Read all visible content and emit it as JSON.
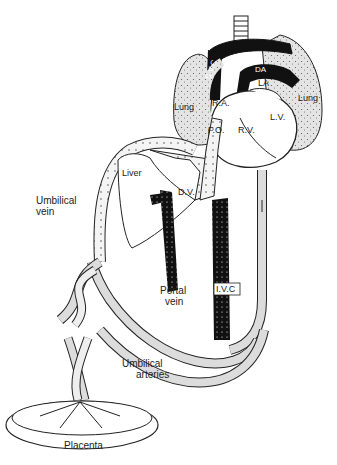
{
  "diagram": {
    "colors": {
      "background": "#ffffff",
      "ink": "#1a1a1a",
      "lung_fill": "#e2e2e2",
      "vessel_light": "#dcdcdc",
      "vessel_dark": "#111111",
      "stipple_white": "#ffffff"
    },
    "labels": {
      "svc": "S.V.C",
      "da": "DA",
      "la": "LA",
      "ra": "R.A.",
      "fo": "F.O.",
      "rv": "R.V.",
      "lv": "L.V.",
      "lung_left": "Lung",
      "lung_right": "Lung",
      "liver": "Liver",
      "dv": "D.V.",
      "umbilical_vein_1": "Umbilical",
      "umbilical_vein_2": "vein",
      "portal_vein_1": "Portal",
      "portal_vein_2": "vein",
      "ivc": "I.V.C",
      "umbilical_arteries_1": "Umbilical",
      "umbilical_arteries_2": "arteries",
      "placenta": "Placenta"
    }
  }
}
